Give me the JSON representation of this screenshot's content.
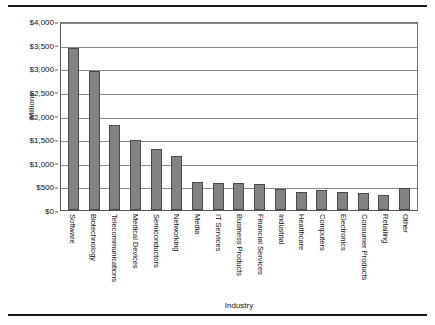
{
  "chart_data": {
    "type": "bar",
    "title": "",
    "xlabel": "Industry",
    "ylabel": "Millions",
    "ylim": [
      0,
      4000
    ],
    "ytick_step": 500,
    "grid": true,
    "legend": false,
    "bar_color": "#828282",
    "bar_edge_color": "#4a4a4a",
    "ytick_labels": [
      "$4,000",
      "$3,500",
      "$3,000",
      "$2,500",
      "$2,000",
      "$1,500",
      "$1,000",
      "$500",
      "$0"
    ],
    "ytick_values": [
      4000,
      3500,
      3000,
      2500,
      2000,
      1500,
      1000,
      500,
      0
    ],
    "categories": [
      "Software",
      "Biotechnology",
      "Telecommunications",
      "Medical Devices",
      "Semiconductors",
      "Networking",
      "Media",
      "IT Services",
      "Business Products",
      "Financial Services",
      "Industrial",
      "Healthcare",
      "Computers",
      "Electronics",
      "Consumer Products",
      "Retailing",
      "Other"
    ],
    "values": [
      3430,
      2940,
      1800,
      1490,
      1290,
      1140,
      600,
      570,
      565,
      550,
      440,
      390,
      420,
      390,
      360,
      320,
      470
    ]
  }
}
